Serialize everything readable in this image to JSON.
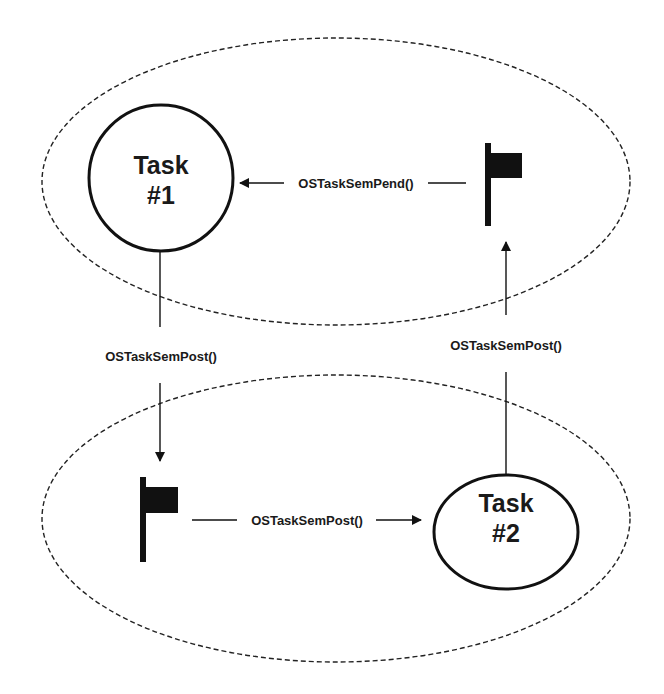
{
  "diagram": {
    "colors": {
      "stroke": "#111111",
      "background": "#ffffff",
      "text": "#1a1a1a"
    },
    "regions": [
      {
        "id": "top-region",
        "shape": "dashed-ellipse"
      },
      {
        "id": "bottom-region",
        "shape": "dashed-ellipse"
      }
    ],
    "tasks": [
      {
        "id": "task1",
        "line1": "Task",
        "line2": "#1"
      },
      {
        "id": "task2",
        "line1": "Task",
        "line2": "#2"
      }
    ],
    "semaphores": [
      {
        "id": "flag-top",
        "icon": "flag-icon"
      },
      {
        "id": "flag-bottom",
        "icon": "flag-icon"
      }
    ],
    "arrows": [
      {
        "id": "pend-arrow",
        "from": "flag-top",
        "to": "task1",
        "label": "OSTaskSemPend()"
      },
      {
        "id": "post-task1-to-flag-bottom",
        "from": "task1",
        "to": "flag-bottom",
        "label": "OSTaskSemPost()"
      },
      {
        "id": "post-flag-bottom-to-task2",
        "from": "flag-bottom",
        "to": "task2",
        "label": "OSTaskSemPost()"
      },
      {
        "id": "post-task2-to-flag-top",
        "from": "task2",
        "to": "flag-top",
        "label": "OSTaskSemPost()"
      }
    ]
  }
}
